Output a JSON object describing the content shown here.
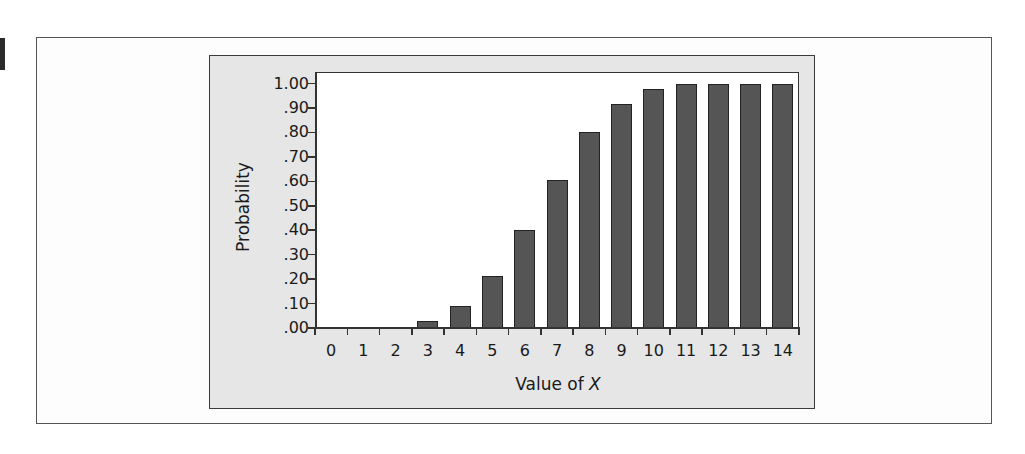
{
  "figure": {
    "marker_color": "#2b2b2b",
    "panel_background": "#e6e6e6",
    "plot_background": "#ffffff",
    "bar_color": "#555555"
  },
  "chart_data": {
    "type": "bar",
    "title": "",
    "xlabel_prefix": "Value of ",
    "xlabel_var": "X",
    "xlabel": "Value of X",
    "ylabel": "Probability",
    "categories": [
      "0",
      "1",
      "2",
      "3",
      "4",
      "5",
      "6",
      "7",
      "8",
      "9",
      "10",
      "11",
      "12",
      "13",
      "14"
    ],
    "values": [
      0.0,
      0.0,
      0.006,
      0.029,
      0.091,
      0.213,
      0.4,
      0.605,
      0.8,
      0.916,
      0.976,
      0.998,
      1.0,
      1.0,
      1.0
    ],
    "yticks": [
      1.0,
      0.9,
      0.8,
      0.7,
      0.6,
      0.5,
      0.4,
      0.3,
      0.2,
      0.1,
      0.0
    ],
    "ytick_labels": [
      "1.00",
      ".90",
      ".80",
      ".70",
      ".60",
      ".50",
      ".40",
      ".30",
      ".20",
      ".10",
      ".00"
    ],
    "ylim": [
      0,
      1.05
    ],
    "grid": false,
    "legend": null
  }
}
